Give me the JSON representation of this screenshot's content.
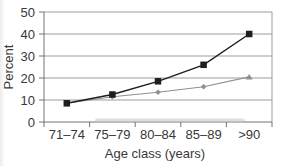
{
  "chart_data": {
    "type": "line",
    "categories": [
      "71–74",
      "75–79",
      "80–84",
      "85–89",
      ">90"
    ],
    "series": [
      {
        "name": "upper-series",
        "values": [
          8.5,
          12.5,
          18.5,
          26,
          40
        ],
        "color": "#1e1e1e",
        "marker": "square"
      },
      {
        "name": "lower-series",
        "values": [
          8.5,
          11.5,
          13.5,
          16,
          20.5
        ],
        "color": "#8f8f8f",
        "marker": "diamond",
        "last_marker": "triangle"
      }
    ],
    "xlabel": "Age class (years)",
    "ylabel": "Percent",
    "ylim": [
      0,
      50
    ],
    "yticks": [
      0,
      10,
      20,
      30,
      40,
      50
    ],
    "grid": true,
    "legend": "none"
  },
  "colors": {
    "background": "#ffffff",
    "grid": "#9d9d9d",
    "axis": "#757575",
    "text": "#383838",
    "scan_artifact": "#c4c4c4"
  }
}
